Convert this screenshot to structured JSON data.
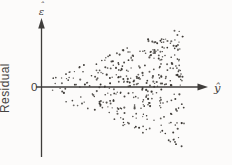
{
  "figure": {
    "width": 232,
    "height": 165,
    "background": "#fcfbfa",
    "axis_color": "#3f3d3b",
    "dot_color": "#34312d",
    "label_color": "#454340"
  },
  "labels": {
    "y_axis_symbol": "ε",
    "y_axis_symbol_hat": "ˆ",
    "x_axis_symbol": "ŷ",
    "origin": "0",
    "y_axis_title": "Residual"
  },
  "chart_data": {
    "type": "scatter",
    "title": "",
    "xlabel": "ŷ",
    "ylabel": "Residual",
    "y_symbol": "ε̂",
    "origin_label": "0",
    "axis_row_y_px": 87,
    "points_x_range_px": [
      46,
      184
    ],
    "half_spread_px": [
      6,
      61
    ],
    "spread_exponent": 0.9,
    "n_points": 380,
    "dot_radius_px": [
      0.65,
      1.1
    ],
    "seed": 1337,
    "grid": false,
    "legend": false
  }
}
